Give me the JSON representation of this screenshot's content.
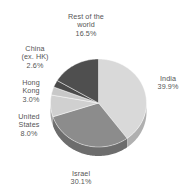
{
  "chart_data": {
    "type": "pie",
    "title": "",
    "subtitle": "",
    "xlabel": "",
    "ylabel": "",
    "legend_position": "outside-labels",
    "grid": false,
    "value_suffix": "%",
    "categories": [
      "India",
      "Israel",
      "Rest of the world",
      "United States",
      "Hong Kong",
      "China (ex. HK)"
    ],
    "values": [
      39.9,
      30.1,
      16.5,
      8.0,
      3.0,
      2.6
    ],
    "slices": [
      {
        "name": "India",
        "label": "India",
        "value": 39.9,
        "value_text": "39.9%",
        "color": "#d9d9d9",
        "side_color": "#b0b0b0"
      },
      {
        "name": "Israel",
        "label": "Israel",
        "value": 30.1,
        "value_text": "30.1%",
        "color": "#8c8c8c",
        "side_color": "#6d6d6d"
      },
      {
        "name": "United States",
        "label": "United\nStates",
        "value": 8.0,
        "value_text": "8.0%",
        "color": "#d0d0d0",
        "side_color": "#a6a6a6"
      },
      {
        "name": "Hong Kong",
        "label": "Hong\nKong",
        "value": 3.0,
        "value_text": "3.0%",
        "color": "#c8c8c8",
        "side_color": "#9e9e9e"
      },
      {
        "name": "China (ex. HK)",
        "label": "China\n(ex. HK)",
        "value": 2.6,
        "value_text": "2.6%",
        "color": "#4a4a4a",
        "side_color": "#3a3a3a"
      },
      {
        "name": "Rest of the world",
        "label": "Rest of the\nworld",
        "value": 16.5,
        "value_text": "16.5%",
        "color": "#4f4f4f",
        "side_color": "#3e3e3e"
      }
    ]
  },
  "labels": {
    "rest_of_world": {
      "name": "Rest of the\nworld",
      "value": "16.5%"
    },
    "china": {
      "name": "China\n(ex. HK)",
      "value": "2.6%"
    },
    "hong_kong": {
      "name": "Hong\nKong",
      "value": "3.0%"
    },
    "united_states": {
      "name": "United\nStates",
      "value": "8.0%"
    },
    "israel": {
      "name": "Israel",
      "value": "30.1%"
    },
    "india": {
      "name": "India",
      "value": "39.9%"
    }
  },
  "colors": {
    "text": "#555555",
    "background": "#ffffff",
    "india": "#d9d9d9",
    "israel": "#8c8c8c",
    "united_states": "#d0d0d0",
    "hong_kong": "#c8c8c8",
    "china": "#4a4a4a",
    "rest_of_world": "#4f4f4f"
  }
}
